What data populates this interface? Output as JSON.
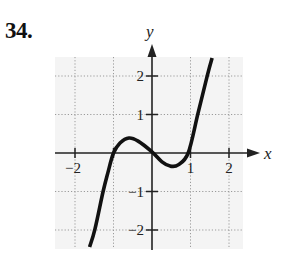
{
  "problem": {
    "number": "34."
  },
  "chart_data": {
    "type": "line",
    "title": "",
    "xlabel": "x",
    "ylabel": "y",
    "xlim": [
      -2.5,
      2.3
    ],
    "ylim": [
      -2.5,
      2.5
    ],
    "grid": true,
    "grid_style": "dotted",
    "x_ticks": [
      -2,
      -1,
      1,
      2
    ],
    "x_tick_labels": [
      "-2",
      "",
      "1",
      "2"
    ],
    "y_ticks": [
      -2,
      -1,
      1,
      2
    ],
    "y_tick_labels": [
      "-2",
      "-1",
      "1",
      "2"
    ],
    "series": [
      {
        "name": "f(x)",
        "description": "cubic-like curve crossing x-axis at -1, 0, 1; local max ~0.4 near x=-0.6, local min ~-0.35 near x=0.5",
        "x": [
          -1.62,
          -1.48,
          -1.27,
          -1.14,
          -1.0,
          -0.83,
          -0.6,
          -0.36,
          0.0,
          0.26,
          0.47,
          0.68,
          0.94,
          1.19,
          1.43,
          1.56
        ],
        "y": [
          -2.44,
          -1.97,
          -1.0,
          -0.49,
          0.0,
          0.26,
          0.39,
          0.31,
          0.03,
          -0.23,
          -0.34,
          -0.31,
          0.0,
          1.01,
          1.99,
          2.47
        ]
      }
    ],
    "colors": {
      "curve": "#111111",
      "axis": "#222222",
      "grid": "#9a9a9a",
      "grid_background": "#f2f2f2"
    }
  }
}
